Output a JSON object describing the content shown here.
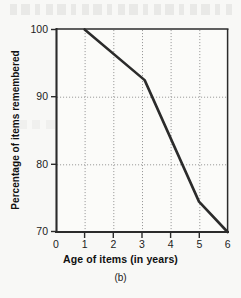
{
  "figure": {
    "caption": "(b)",
    "background_color": "#f8f8f6",
    "ink_color": "#2b2b2b"
  },
  "chart_data": {
    "type": "line",
    "title": "",
    "xlabel": "Age of items (in years)",
    "ylabel": "Percentage of items remembered",
    "xlim": [
      0,
      6
    ],
    "ylim": [
      70,
      100
    ],
    "xticks": [
      "0",
      "1",
      "2",
      "3",
      "4",
      "5",
      "6"
    ],
    "yticks": [
      "70",
      "80",
      "90",
      "100"
    ],
    "grid": "dotted both axes",
    "legend": "none",
    "series": [
      {
        "name": "Percentage of items remembered",
        "x": [
          1,
          3.1,
          5,
          6
        ],
        "values": [
          100,
          92.5,
          74.5,
          70
        ]
      }
    ],
    "line_color": "#2b2b2b",
    "line_width": 2.6,
    "annotations": [
      "(b)"
    ]
  }
}
